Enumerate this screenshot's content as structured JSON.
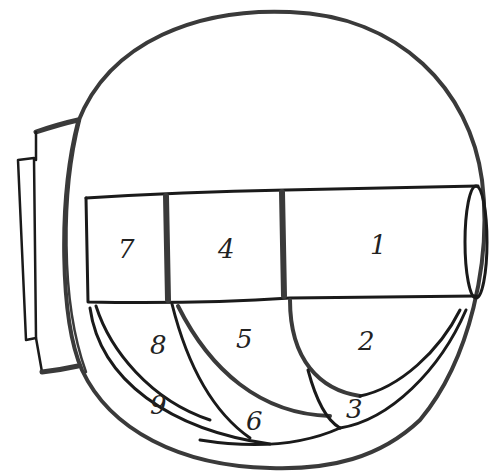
{
  "diagram": {
    "type": "hand-drawn sketch",
    "top_row": [
      {
        "id": "compartment-7",
        "label": "7"
      },
      {
        "id": "compartment-4",
        "label": "4"
      },
      {
        "id": "compartment-1",
        "label": "1"
      }
    ],
    "middle_row": [
      {
        "id": "compartment-8",
        "label": "8"
      },
      {
        "id": "compartment-5",
        "label": "5"
      },
      {
        "id": "compartment-2",
        "label": "2"
      }
    ],
    "bottom_row": [
      {
        "id": "compartment-9",
        "label": "9"
      },
      {
        "id": "compartment-6",
        "label": "6"
      },
      {
        "id": "compartment-3",
        "label": "3"
      }
    ],
    "colors": {
      "stroke": "#1a1a1a",
      "background": "#ffffff"
    }
  }
}
